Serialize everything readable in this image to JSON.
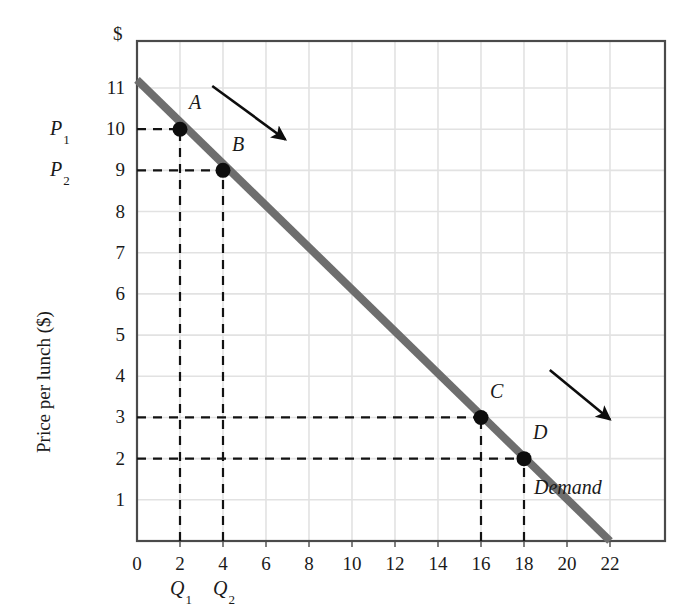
{
  "figure": {
    "name": "demand-curve-figure",
    "y_axis_title": "Price per lunch ($)",
    "y_axis_unit_marker": "$",
    "curve_label": "Demand",
    "background_color": "#ffffff",
    "curve_color": "#6e6e6e",
    "grid_color": "#e2e2e2",
    "axis_color": "#4a4a4a",
    "point_color": "#0d0d0d"
  },
  "chart_data": {
    "type": "line",
    "title": "",
    "subtitle": "",
    "xlabel": "",
    "ylabel": "Price per lunch ($)",
    "xlim": [
      0,
      23
    ],
    "ylim": [
      0,
      11.8
    ],
    "grid": true,
    "legend_position": "inline-right",
    "x_ticks": [
      0,
      2,
      4,
      6,
      8,
      10,
      12,
      14,
      16,
      18,
      20,
      22
    ],
    "x_tick_labels": [
      "0",
      "2",
      "4",
      "6",
      "8",
      "10",
      "12",
      "14",
      "16",
      "18",
      "20",
      "22"
    ],
    "y_ticks": [
      1,
      2,
      3,
      4,
      5,
      6,
      7,
      8,
      9,
      10,
      11
    ],
    "y_tick_labels": [
      "1",
      "2",
      "3",
      "4",
      "5",
      "6",
      "7",
      "8",
      "9",
      "10",
      "11"
    ],
    "series": [
      {
        "name": "Demand",
        "type": "line",
        "color": "#6e6e6e",
        "x": [
          0,
          22
        ],
        "y": [
          11.2,
          0
        ],
        "label": "Demand",
        "label_x": 20.0,
        "label_y": 1.25
      }
    ],
    "annotations": [
      {
        "name": "point-a",
        "label": "A",
        "x": 2,
        "y": 10,
        "label_x": 2.6,
        "label_y": 10.6,
        "price_ref": "P1",
        "quantity_ref": "Q1"
      },
      {
        "name": "point-b",
        "label": "B",
        "x": 4,
        "y": 9,
        "label_x": 4.6,
        "label_y": 9.6,
        "price_ref": "P2",
        "quantity_ref": "Q2"
      },
      {
        "name": "point-c",
        "label": "C",
        "x": 16,
        "y": 3,
        "label_x": 16.6,
        "label_y": 3.6,
        "price_ref": "",
        "quantity_ref": ""
      },
      {
        "name": "point-d",
        "label": "D",
        "x": 18,
        "y": 2,
        "label_x": 18.6,
        "label_y": 2.6,
        "price_ref": "",
        "quantity_ref": ""
      }
    ],
    "arrows": [
      {
        "name": "movement-arrow-upper",
        "x1": 3.5,
        "y1": 11.05,
        "x2": 6.9,
        "y2": 9.75
      },
      {
        "name": "movement-arrow-lower",
        "x1": 19.2,
        "y1": 4.15,
        "x2": 22.0,
        "y2": 2.95
      }
    ],
    "reference_lines": [
      {
        "name": "p1-dashed-horizontal",
        "orientation": "horizontal",
        "value": 10,
        "from": 0,
        "to": 2
      },
      {
        "name": "p2-dashed-horizontal",
        "orientation": "horizontal",
        "value": 9,
        "from": 0,
        "to": 4
      },
      {
        "name": "p3-dashed-horizontal",
        "orientation": "horizontal",
        "value": 3,
        "from": 0,
        "to": 16
      },
      {
        "name": "p4-dashed-horizontal",
        "orientation": "horizontal",
        "value": 2,
        "from": 0,
        "to": 18
      },
      {
        "name": "q1-dashed-vertical",
        "orientation": "vertical",
        "value": 2,
        "from": 0,
        "to": 10
      },
      {
        "name": "q2-dashed-vertical",
        "orientation": "vertical",
        "value": 4,
        "from": 0,
        "to": 9
      },
      {
        "name": "q3-dashed-vertical",
        "orientation": "vertical",
        "value": 16,
        "from": 0,
        "to": 3
      },
      {
        "name": "q4-dashed-vertical",
        "orientation": "vertical",
        "value": 18,
        "from": 0,
        "to": 2
      }
    ]
  },
  "axis_labels": {
    "price_labels": [
      {
        "name": "p1-label",
        "base": "P",
        "sub": "1",
        "y_value": 10
      },
      {
        "name": "p2-label",
        "base": "P",
        "sub": "2",
        "y_value": 9
      }
    ],
    "quantity_labels": [
      {
        "name": "q1-label",
        "base": "Q",
        "sub": "1",
        "x_value": 2
      },
      {
        "name": "q2-label",
        "base": "Q",
        "sub": "2",
        "x_value": 4
      }
    ]
  }
}
